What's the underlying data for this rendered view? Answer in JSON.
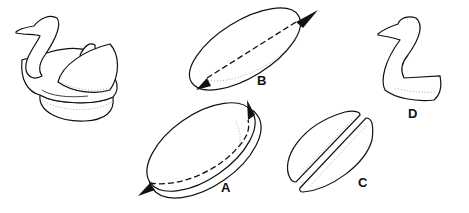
{
  "figure": {
    "panels": [
      {
        "id": "assembled",
        "label": "",
        "content": "Completed swan with neck and wing pieces on base"
      },
      {
        "id": "A",
        "label": "A",
        "content": "Round loaf with dashed horizontal cut line around side and arrows"
      },
      {
        "id": "B",
        "label": "B",
        "content": "Top disc with dashed cut line across diameter and arrows"
      },
      {
        "id": "C",
        "label": "C",
        "content": "Disc cut into two halves (wings)"
      },
      {
        "id": "D",
        "label": "D",
        "content": "Swan neck and head piece"
      }
    ],
    "colors": {
      "line": "#111111",
      "background": "#ffffff"
    }
  }
}
